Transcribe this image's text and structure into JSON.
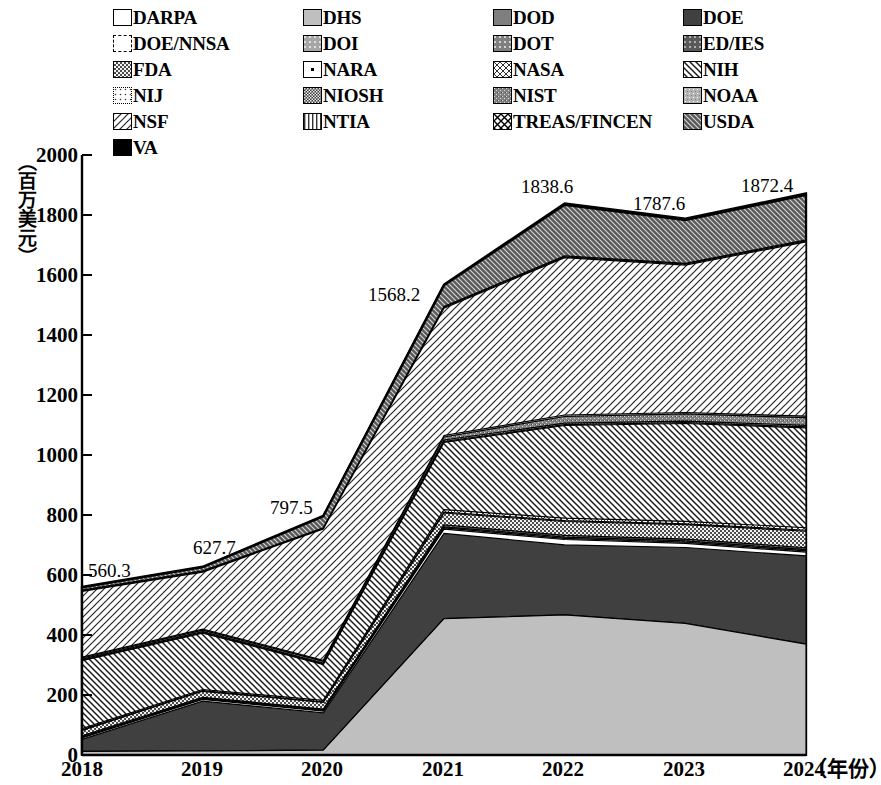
{
  "chart_data": {
    "type": "area",
    "title": "",
    "subtitle": "",
    "xlabel": "（年份）",
    "ylabel": "（百万美元）",
    "x": [
      "2018",
      "2019",
      "2020",
      "2021",
      "2022",
      "2023",
      "2024"
    ],
    "xticklabels": [
      "2018",
      "2019",
      "2020",
      "2021",
      "2022",
      "2023",
      "2024"
    ],
    "yticklabels": [
      "0",
      "200",
      "400",
      "600",
      "800",
      "1000",
      "1200",
      "1400",
      "1600",
      "1800",
      "2000"
    ],
    "ylim": [
      0,
      2000
    ],
    "ytick_step": 200,
    "grid": false,
    "legend_position": "top",
    "stacked": true,
    "totals": [
      560.3,
      627.7,
      797.5,
      1568.2,
      1838.6,
      1787.6,
      1872.4
    ],
    "total_labels": [
      "560.3",
      "627.7",
      "797.5",
      "1568.2",
      "1838.6",
      "1787.6",
      "1872.4"
    ],
    "series": [
      {
        "name": "DARPA",
        "pattern": "solid-white",
        "color": "#ffffff",
        "values": [
          0,
          0,
          0,
          0,
          0,
          0,
          0
        ]
      },
      {
        "name": "DHS",
        "pattern": "solid-lightgray",
        "color": "#bfbfbf",
        "values": [
          12,
          14,
          16,
          455,
          467,
          440,
          350
        ]
      },
      {
        "name": "DOD",
        "pattern": "solid-midgray",
        "color": "#7f7f7f",
        "values": [
          0,
          0,
          0,
          0,
          0,
          0,
          0
        ]
      },
      {
        "name": "DOE",
        "pattern": "solid-darkgray",
        "color": "#404040",
        "values": [
          40,
          165,
          125,
          285,
          233,
          253,
          278
        ]
      },
      {
        "name": "DOE/NNSA",
        "pattern": "dash-white",
        "color": "#ffffff",
        "values": [
          5,
          6,
          6,
          14,
          18,
          14,
          12
        ]
      },
      {
        "name": "DOI",
        "pattern": "dot-lightgray",
        "color": "#a6a6a6",
        "values": [
          2,
          2,
          2,
          4,
          4,
          4,
          4
        ]
      },
      {
        "name": "DOT",
        "pattern": "dot-midgray",
        "color": "#808080",
        "values": [
          2,
          2,
          2,
          4,
          4,
          4,
          4
        ]
      },
      {
        "name": "ED/IES",
        "pattern": "dot-darkgray",
        "color": "#595959",
        "values": [
          3,
          3,
          3,
          6,
          6,
          6,
          6
        ]
      },
      {
        "name": "FDA",
        "pattern": "check-dark",
        "color": "#4d4d4d",
        "values": [
          18,
          20,
          22,
          40,
          46,
          48,
          52
        ]
      },
      {
        "name": "NARA",
        "pattern": "dot-sparse",
        "color": "#ffffff",
        "values": [
          2,
          2,
          2,
          3,
          3,
          3,
          3
        ]
      },
      {
        "name": "NASA",
        "pattern": "xbox-thin",
        "color": "#ffffff",
        "values": [
          4,
          4,
          5,
          8,
          8,
          8,
          8
        ]
      },
      {
        "name": "NIH",
        "pattern": "diag-back",
        "color": "#ffffff",
        "values": [
          226,
          188,
          120,
          225,
          309,
          327,
          315
        ]
      },
      {
        "name": "NIJ",
        "pattern": "dot-white",
        "color": "#ffffff",
        "values": [
          2,
          2,
          2,
          3,
          3,
          3,
          3
        ]
      },
      {
        "name": "NIOSH",
        "pattern": "check-fine",
        "color": "#595959",
        "values": [
          3,
          3,
          3,
          5,
          5,
          5,
          5
        ]
      },
      {
        "name": "NIST",
        "pattern": "grain-midgray",
        "color": "#808080",
        "values": [
          4,
          5,
          6,
          10,
          22,
          24,
          24
        ]
      },
      {
        "name": "NOAA",
        "pattern": "grain-light",
        "color": "#b3b3b3",
        "values": [
          3,
          3,
          3,
          5,
          5,
          5,
          5
        ]
      },
      {
        "name": "NSF",
        "pattern": "diag-fwd",
        "color": "#ffffff",
        "values": [
          219,
          190,
          440,
          425,
          524,
          492,
          550
        ]
      },
      {
        "name": "NTIA",
        "pattern": "vert-lines",
        "color": "#ffffff",
        "values": [
          2,
          2,
          2,
          3,
          3,
          3,
          3
        ]
      },
      {
        "name": "TREAS/FINCEN",
        "pattern": "xbox-bold",
        "color": "#ffffff",
        "values": [
          2,
          2,
          2,
          3,
          3,
          3,
          3
        ]
      },
      {
        "name": "USDA",
        "pattern": "brick-dark",
        "color": "#595959",
        "values": [
          9,
          12,
          38,
          70,
          170,
          144,
          142
        ]
      },
      {
        "name": "VA",
        "pattern": "solid-black",
        "color": "#000000",
        "values": [
          2,
          2,
          2,
          3,
          5,
          5,
          5
        ]
      }
    ],
    "annotations": [
      {
        "text": "560.3",
        "x": "2018",
        "value": 560.3
      },
      {
        "text": "627.7",
        "x": "2019",
        "value": 627.7
      },
      {
        "text": "797.5",
        "x": "2020",
        "value": 797.5
      },
      {
        "text": "1568.2",
        "x": "2021",
        "value": 1568.2
      },
      {
        "text": "1838.6",
        "x": "2022",
        "value": 1838.6
      },
      {
        "text": "1787.6",
        "x": "2023",
        "value": 1787.6
      },
      {
        "text": "1872.4",
        "x": "2024",
        "value": 1872.4
      }
    ]
  },
  "legend": {
    "rows": [
      [
        {
          "label": "DARPA",
          "pattern": "solid-white"
        },
        {
          "label": "DHS",
          "pattern": "solid-lightgray"
        },
        {
          "label": "DOD",
          "pattern": "solid-midgray"
        },
        {
          "label": "DOE",
          "pattern": "solid-darkgray"
        }
      ],
      [
        {
          "label": "DOE/NNSA",
          "pattern": "dash-white"
        },
        {
          "label": "DOI",
          "pattern": "dot-lightgray"
        },
        {
          "label": "DOT",
          "pattern": "dot-midgray"
        },
        {
          "label": "ED/IES",
          "pattern": "dot-darkgray"
        }
      ],
      [
        {
          "label": "FDA",
          "pattern": "check-dark"
        },
        {
          "label": "NARA",
          "pattern": "dot-sparse"
        },
        {
          "label": "NASA",
          "pattern": "xbox-thin"
        },
        {
          "label": "NIH",
          "pattern": "diag-back"
        }
      ],
      [
        {
          "label": "NIJ",
          "pattern": "dot-white"
        },
        {
          "label": "NIOSH",
          "pattern": "check-fine"
        },
        {
          "label": "NIST",
          "pattern": "grain-midgray"
        },
        {
          "label": "NOAA",
          "pattern": "grain-light"
        }
      ],
      [
        {
          "label": "NSF",
          "pattern": "diag-fwd"
        },
        {
          "label": "NTIA",
          "pattern": "vert-lines"
        },
        {
          "label": "TREAS/FINCEN",
          "pattern": "xbox-bold"
        },
        {
          "label": "USDA",
          "pattern": "brick-dark"
        }
      ],
      [
        {
          "label": "VA",
          "pattern": "solid-black"
        }
      ]
    ]
  },
  "axes": {
    "y_ticks": [
      "2000",
      "1800",
      "1600",
      "1400",
      "1200",
      "1000",
      "800",
      "600",
      "400",
      "200",
      "0"
    ],
    "y_title": "（百万美元）",
    "x_ticks": [
      "2018",
      "2019",
      "2020",
      "2021",
      "2022",
      "2023",
      "2024"
    ],
    "x_unit": "（年份）"
  }
}
